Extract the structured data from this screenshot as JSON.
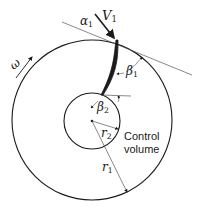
{
  "diagram": {
    "labels": {
      "alpha": "α",
      "alpha_sub": "1",
      "velocity": "V",
      "velocity_sub": "1",
      "omega": "ω",
      "beta1": "β",
      "beta1_sub": "1",
      "beta2": "β",
      "beta2_sub": "2",
      "r2": "r",
      "r2_sub": "2",
      "r1": "r",
      "r1_sub": "1",
      "control_volume_line1": "Control",
      "control_volume_line2": "volume"
    },
    "colors": {
      "stroke": "#1a1a1a",
      "thin_line": "#555555",
      "background": "#ffffff"
    }
  }
}
